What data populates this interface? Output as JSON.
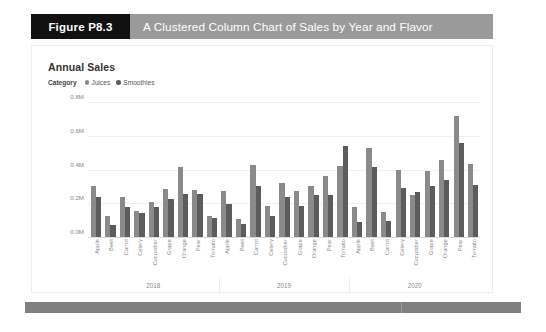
{
  "figure": {
    "tag": "Figure P8.3",
    "caption": "A Clustered Column Chart of Sales by Year and Flavor"
  },
  "colors": {
    "tag_background": "#111111",
    "banner_background": "#9a9a9a",
    "juices": "#8a8a8a",
    "smoothies": "#5c5c5c",
    "footer": "#808080"
  },
  "chart_data": {
    "type": "bar",
    "title": "Annual Sales",
    "legend_title": "Category",
    "legend_position": "top-left",
    "grid": true,
    "xlabel": "",
    "ylabel": "",
    "ylim": [
      0,
      0.8
    ],
    "ytick_labels": [
      "0.0M",
      "0.2M",
      "0.4M",
      "0.6M",
      "0.8M"
    ],
    "ytick_values": [
      0.0,
      0.2,
      0.4,
      0.6,
      0.8
    ],
    "groups": [
      "2018",
      "2019",
      "2020"
    ],
    "categories": [
      "Apple",
      "Beet",
      "Carrot",
      "Celery",
      "Cucumber",
      "Grape",
      "Orange",
      "Pear",
      "Tomato"
    ],
    "series": [
      {
        "name": "Juices",
        "color": "#8a8a8a",
        "values_by_group": {
          "2018": [
            0.3,
            0.125,
            0.235,
            0.155,
            0.205,
            0.285,
            0.415,
            0.28,
            0.125
          ],
          "2019": [
            0.275,
            0.105,
            0.425,
            0.185,
            0.32,
            0.27,
            0.3,
            0.36,
            0.42
          ],
          "2020": [
            0.175,
            0.53,
            0.15,
            0.4,
            0.25,
            0.39,
            0.455,
            0.72,
            0.43
          ]
        }
      },
      {
        "name": "Smoothies",
        "color": "#5c5c5c",
        "values_by_group": {
          "2018": [
            0.24,
            0.07,
            0.18,
            0.145,
            0.175,
            0.225,
            0.255,
            0.255,
            0.11
          ],
          "2019": [
            0.195,
            0.075,
            0.3,
            0.125,
            0.24,
            0.185,
            0.25,
            0.25,
            0.54
          ],
          "2020": [
            0.09,
            0.415,
            0.095,
            0.29,
            0.265,
            0.305,
            0.335,
            0.555,
            0.31
          ]
        }
      }
    ]
  }
}
